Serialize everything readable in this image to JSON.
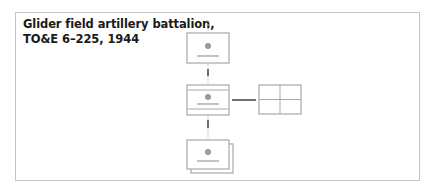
{
  "title": {
    "line1": "Glider field artillery battalion,",
    "line2": "TO&E 6–225, 1944"
  },
  "diagram": {
    "type": "org-chart",
    "nodes": [
      {
        "id": "parent",
        "kind": "unit-symbol",
        "marking": "dot-with-bar",
        "label": ""
      },
      {
        "id": "hq",
        "kind": "headquarters-symbol",
        "marking": "dot-with-bar-banded",
        "label": ""
      },
      {
        "id": "attached",
        "kind": "quad-grid",
        "label": ""
      },
      {
        "id": "subordinate",
        "kind": "stacked-unit-symbol",
        "marking": "dot-with-bar",
        "label": ""
      }
    ],
    "edges": [
      {
        "from": "parent",
        "to": "hq",
        "style": "solid-with-dashed-ends"
      },
      {
        "from": "hq",
        "to": "attached",
        "style": "solid"
      },
      {
        "from": "hq",
        "to": "subordinate",
        "style": "solid-with-dashed-ends"
      }
    ],
    "colors": {
      "frame": "#c4c4c4",
      "box_stroke": "#a8a8a8",
      "dot": "#9a9a9a",
      "line": "#333333",
      "text": "#1a1a1a"
    }
  }
}
